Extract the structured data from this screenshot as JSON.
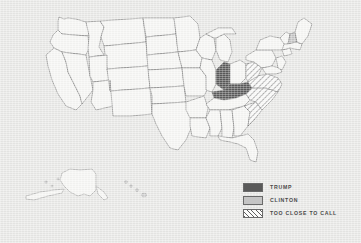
{
  "figure": {
    "type": "choropleth-map",
    "background_color": "#e9e9e7",
    "includes_insets": [
      "alaska",
      "hawaii"
    ]
  },
  "legend": {
    "position": "bottom-right",
    "items": [
      {
        "key": "trump",
        "label": "TRUMP",
        "swatch": "solid-dark-gray",
        "color": "#5a5a5a"
      },
      {
        "key": "clinton",
        "label": "CLINTON",
        "swatch": "solid-light-gray",
        "color": "#c5c5c5"
      },
      {
        "key": "close",
        "label": "TOO CLOSE TO CALL",
        "swatch": "diagonal-hatch",
        "color": "#ffffff"
      }
    ]
  },
  "map_data": {
    "type": "choropleth",
    "categories": [
      "TRUMP",
      "CLINTON",
      "TOO CLOSE TO CALL",
      "UNSHADED"
    ],
    "colors": {
      "TRUMP": "#5a5a5a",
      "CLINTON": "#c5c5c5",
      "TOO CLOSE TO CALL": "#ffffff",
      "UNSHADED": "#f7f7f5"
    },
    "outline_color": "#6e6e6e",
    "regions": [
      {
        "name": "Kentucky",
        "category": "TRUMP"
      },
      {
        "name": "Indiana",
        "category": "TRUMP"
      },
      {
        "name": "West Virginia",
        "category": "TOO CLOSE TO CALL"
      },
      {
        "name": "Virginia",
        "category": "TOO CLOSE TO CALL"
      },
      {
        "name": "North Carolina",
        "category": "TOO CLOSE TO CALL"
      },
      {
        "name": "South Carolina",
        "category": "TOO CLOSE TO CALL"
      },
      {
        "name": "New Hampshire",
        "category": "CLINTON"
      }
    ]
  }
}
